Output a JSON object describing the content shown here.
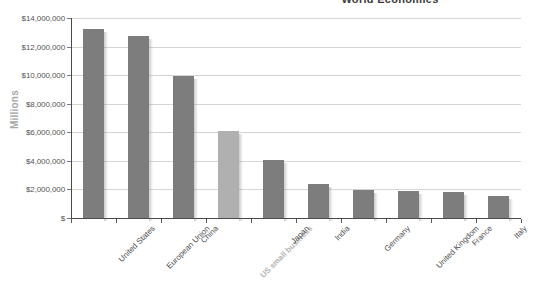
{
  "chart_data": {
    "type": "bar",
    "title": "World Economies",
    "xlabel": "",
    "ylabel": "Millions",
    "ylim": [
      0,
      14000000
    ],
    "grid": true,
    "legend": null,
    "ytick_labels": [
      "$14,000,000",
      "$12,000,000",
      "$10,000,000",
      "$8,000,000",
      "$6,000,000",
      "$4,000,000",
      "$2,000,000",
      "$"
    ],
    "ytick_values": [
      14000000,
      12000000,
      10000000,
      8000000,
      6000000,
      4000000,
      2000000,
      0
    ],
    "categories": [
      "United States",
      "European Union",
      "China",
      "US small business",
      "Japan",
      "India",
      "Germany",
      "United Kingdom",
      "France",
      "Italy"
    ],
    "values": [
      13200000,
      12750000,
      9950000,
      6100000,
      4050000,
      2350000,
      1990000,
      1880000,
      1800000,
      1550000
    ],
    "bar_styles": [
      "dark",
      "dark",
      "dark",
      "light",
      "dark",
      "dark",
      "dark",
      "dark",
      "dark",
      "dark"
    ],
    "highlight_category": "US small business",
    "colors": {
      "bar_dark": "#7d7d7d",
      "bar_light": "#b0b0b0",
      "gridline": "#d5d5d5",
      "axis": "#4a4a4a",
      "tick_text": "#555555",
      "title": "#3b3b3b",
      "axis_title": "#a8a8a8",
      "highlight_label": "#b4b4b4"
    }
  }
}
